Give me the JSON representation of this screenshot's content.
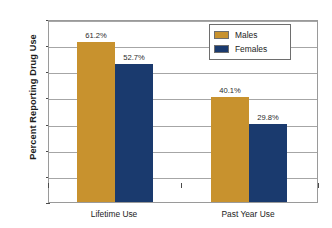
{
  "chart_data": {
    "type": "bar",
    "title": "",
    "subtitle": "",
    "xlabel": "",
    "ylabel": "Percent Reporting Drug Use",
    "categories": [
      "Lifetime Use",
      "Past Year Use"
    ],
    "series": [
      {
        "name": "Males",
        "color": "#c8922e",
        "values": [
          61.2,
          52.7
        ]
      },
      {
        "name": "Females",
        "color": "#1a3a6e",
        "values": [
          52.7,
          29.8
        ]
      }
    ],
    "ylim": [
      0,
      70
    ],
    "yticks": [
      0,
      10,
      20,
      30,
      40,
      50,
      60,
      70
    ],
    "ytick_labels": [
      "0",
      "10",
      "20",
      "30",
      "40",
      "50",
      "60",
      "70"
    ],
    "grid": true,
    "legend_position": "top-right-inside",
    "data_labels": {
      "lifetime_males": "61.2%",
      "lifetime_females": "52.7%",
      "past_year_males": "40.1%",
      "past_year_females": "29.8%"
    },
    "bars": [
      {
        "group": "Lifetime Use",
        "series": "Males",
        "value": 61.2,
        "label": "61.2%"
      },
      {
        "group": "Lifetime Use",
        "series": "Females",
        "value": 52.7,
        "label": "52.7%"
      },
      {
        "group": "Past Year Use",
        "series": "Males",
        "value": 40.1,
        "label": "40.1%"
      },
      {
        "group": "Past Year Use",
        "series": "Females",
        "value": 29.8,
        "label": "29.8%"
      }
    ]
  },
  "legend": {
    "items": [
      {
        "label": "Males",
        "color": "#c8922e"
      },
      {
        "label": "Females",
        "color": "#1a3a6e"
      }
    ]
  },
  "axes": {
    "y_title": "Percent Reporting Drug Use",
    "y_ticks": [
      "70",
      "60",
      "50",
      "40",
      "30",
      "20",
      "10",
      "0"
    ],
    "x_labels": [
      "Lifetime Use",
      "Past Year Use"
    ]
  },
  "colors": {
    "males": "#c8922e",
    "females": "#1a3a6e",
    "gridline": "#a6a6a6",
    "frame": "#9a9a9a",
    "background": "#ffffff",
    "text": "#1c1c1c"
  }
}
